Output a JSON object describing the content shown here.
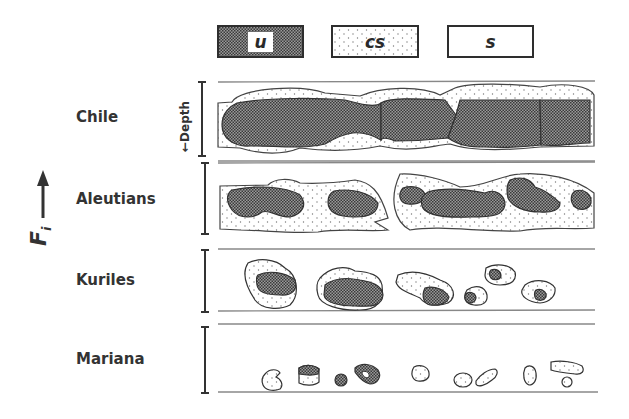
{
  "legend": [
    {
      "key": "u",
      "label": "u",
      "fill": "crosshatch-dark"
    },
    {
      "key": "cs",
      "label": "cs",
      "fill": "stippled"
    },
    {
      "key": "s",
      "label": "s",
      "fill": "blank"
    }
  ],
  "axis": {
    "vertical_label": "F",
    "vertical_label_subscript": "i",
    "depth_label": "←Depth",
    "arrow_direction": "up"
  },
  "rows": [
    {
      "name": "Chile",
      "description": "continuous large dark blocks (u) with stippled margins (cs)"
    },
    {
      "name": "Aleutians",
      "description": "medium dark blobs embedded in continuous stippled band"
    },
    {
      "name": "Kuriles",
      "description": "isolated stippled bodies with dark cores"
    },
    {
      "name": "Mariana",
      "description": "small scattered stippled bodies with few tiny dark cores"
    }
  ],
  "colors": {
    "ink": "#2e2e2e",
    "line": "#8a8a8a",
    "dark_fill": "#6a6a6a",
    "stipple_dot": "#8a8a8a",
    "background": "#ffffff"
  }
}
